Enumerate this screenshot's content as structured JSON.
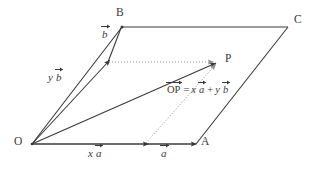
{
  "figure": {
    "type": "vector-parallelogram-diagram",
    "width": 326,
    "height": 169,
    "background_color": "#ffffff",
    "stroke_color": "#3a3a3a",
    "dotted_color": "#8a8a8a",
    "points": {
      "O": {
        "x": 32,
        "y": 144,
        "label": "O",
        "label_x": 14,
        "label_y": 137
      },
      "A": {
        "x": 196,
        "y": 144,
        "label": "A",
        "label_x": 201,
        "label_y": 137
      },
      "B": {
        "x": 122,
        "y": 27,
        "label": "B",
        "label_x": 116,
        "label_y": 8
      },
      "C": {
        "x": 288,
        "y": 27,
        "label": "C",
        "label_x": 294,
        "label_y": 15
      },
      "P": {
        "x": 218,
        "y": 62,
        "label": "P",
        "label_x": 225,
        "label_y": 54
      },
      "xa_end": {
        "x": 146,
        "y": 144
      },
      "yb_end": {
        "x": 108,
        "y": 62
      }
    },
    "labels": {
      "x_a": {
        "var": "x",
        "vec": "a",
        "x": 88,
        "y": 148
      },
      "a": {
        "vec": "a",
        "x": 160,
        "y": 148
      },
      "y_b": {
        "var": "y",
        "vec": "b",
        "x": 50,
        "y": 72
      },
      "b": {
        "vec": "b",
        "x": 102,
        "y": 30
      },
      "equation": {
        "op": "OP",
        "equals": "=",
        "term1_var": "x",
        "term1_vec": "a",
        "plus": "+",
        "term2_var": "y",
        "term2_vec": "b",
        "x": 166,
        "y": 88,
        "full_text": "OP = x a + y b"
      }
    }
  }
}
